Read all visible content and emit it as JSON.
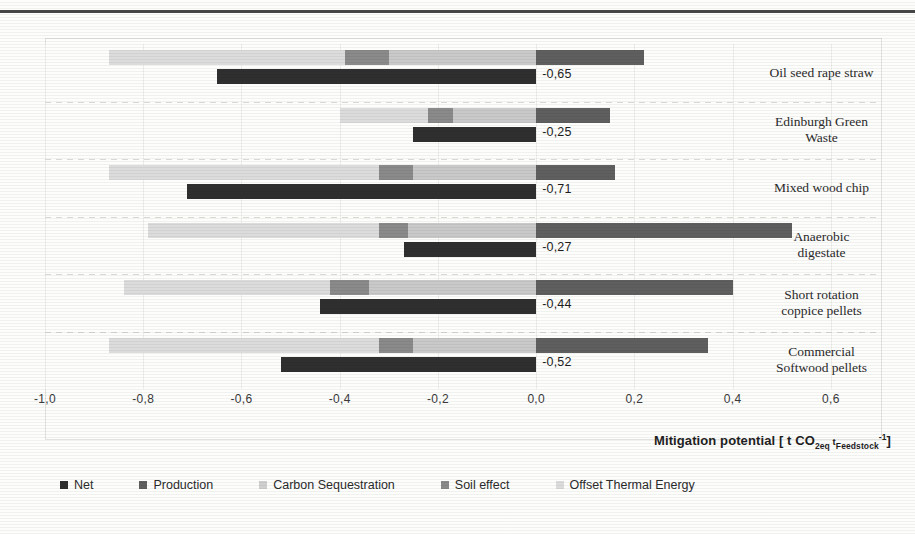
{
  "chart_data": {
    "type": "bar",
    "orientation": "horizontal",
    "stacked": true,
    "title": "",
    "xlabel": "Mitigation potential [ t CO2eq tFeedstock-1]",
    "ylabel": "",
    "xlim": [
      -1.0,
      0.7
    ],
    "xticks": [
      -1.0,
      -0.8,
      -0.6,
      -0.4,
      -0.2,
      0.0,
      0.2,
      0.4,
      0.6
    ],
    "xticklabels": [
      "-1,0",
      "-0,8",
      "-0,6",
      "-0,4",
      "-0,2",
      "0,0",
      "0,2",
      "0,4",
      "0,6"
    ],
    "grid": true,
    "legend_position": "bottom",
    "decimal_separator": ",",
    "categories": [
      "Oil seed rape straw",
      "Edinburgh Green Waste",
      "Mixed wood chip",
      "Anaerobic digestate",
      "Short rotation coppice pellets",
      "Commercial Softwood pellets"
    ],
    "series": [
      {
        "name": "Production",
        "color": "#5f5f5f",
        "values": [
          0.22,
          0.15,
          0.16,
          0.52,
          0.4,
          0.35
        ]
      },
      {
        "name": "Carbon Sequestration",
        "color": "#c9c9c9",
        "values": [
          -0.3,
          -0.17,
          -0.25,
          -0.26,
          -0.34,
          -0.25
        ]
      },
      {
        "name": "Soil effect",
        "color": "#8a8a8a",
        "values": [
          -0.09,
          -0.05,
          -0.07,
          -0.06,
          -0.08,
          -0.07
        ]
      },
      {
        "name": "Offset Thermal Energy",
        "color": "#dcdcdc",
        "values": [
          -0.48,
          -0.18,
          -0.55,
          -0.47,
          -0.42,
          -0.55
        ]
      },
      {
        "name": "Net",
        "color": "#2f2f2f",
        "values": [
          -0.65,
          -0.25,
          -0.71,
          -0.27,
          -0.44,
          -0.52
        ]
      }
    ],
    "net_labels": [
      "-0,65",
      "-0,25",
      "-0,71",
      "-0,27",
      "-0,44",
      "-0,52"
    ]
  },
  "axis": {
    "title_prefix": "Mitigation potential [ t CO",
    "title_sub1": "2eq",
    "title_mid": " t",
    "title_sub2": "Feedstock",
    "title_sup": "-1",
    "title_suffix": "]"
  },
  "category_lines": [
    [
      "Oil seed rape straw"
    ],
    [
      "Edinburgh Green",
      "Waste"
    ],
    [
      "Mixed wood chip"
    ],
    [
      "Anaerobic",
      "digestate"
    ],
    [
      "Short rotation",
      "coppice pellets"
    ],
    [
      "Commercial",
      "Softwood pellets"
    ]
  ],
  "legend": {
    "items": [
      {
        "label": "Net",
        "color": "#2f2f2f"
      },
      {
        "label": "Production",
        "color": "#5f5f5f"
      },
      {
        "label": "Carbon Sequestration",
        "color": "#cfcfcf"
      },
      {
        "label": "Soil effect",
        "color": "#8a8a8a"
      },
      {
        "label": "Offset Thermal Energy",
        "color": "#dcdcdc"
      }
    ]
  }
}
